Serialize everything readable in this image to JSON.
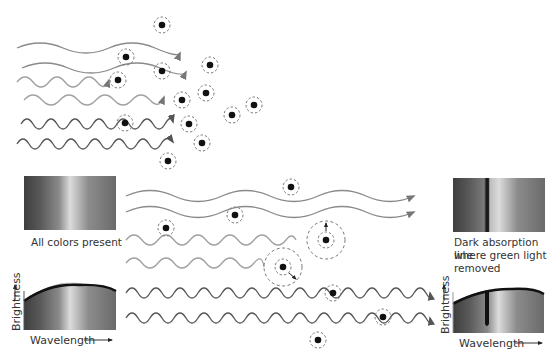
{
  "diagram": {
    "left_panel": {
      "spectrum_caption": "All colors present",
      "y_axis": "Brightness",
      "x_axis": "Wavelength"
    },
    "right_panel": {
      "spectrum_caption_line1": "Dark absorption line",
      "spectrum_caption_line2": "where green light",
      "spectrum_caption_line3": "removed",
      "y_axis": "Brightness",
      "x_axis": "Wavelength"
    },
    "arrow_glyph": "→",
    "colors": {
      "wave_long": "#8a8a8a",
      "wave_mid": "#a0a0a0",
      "wave_short": "#555555",
      "atom": "#111111",
      "orbit": "#777777"
    }
  }
}
